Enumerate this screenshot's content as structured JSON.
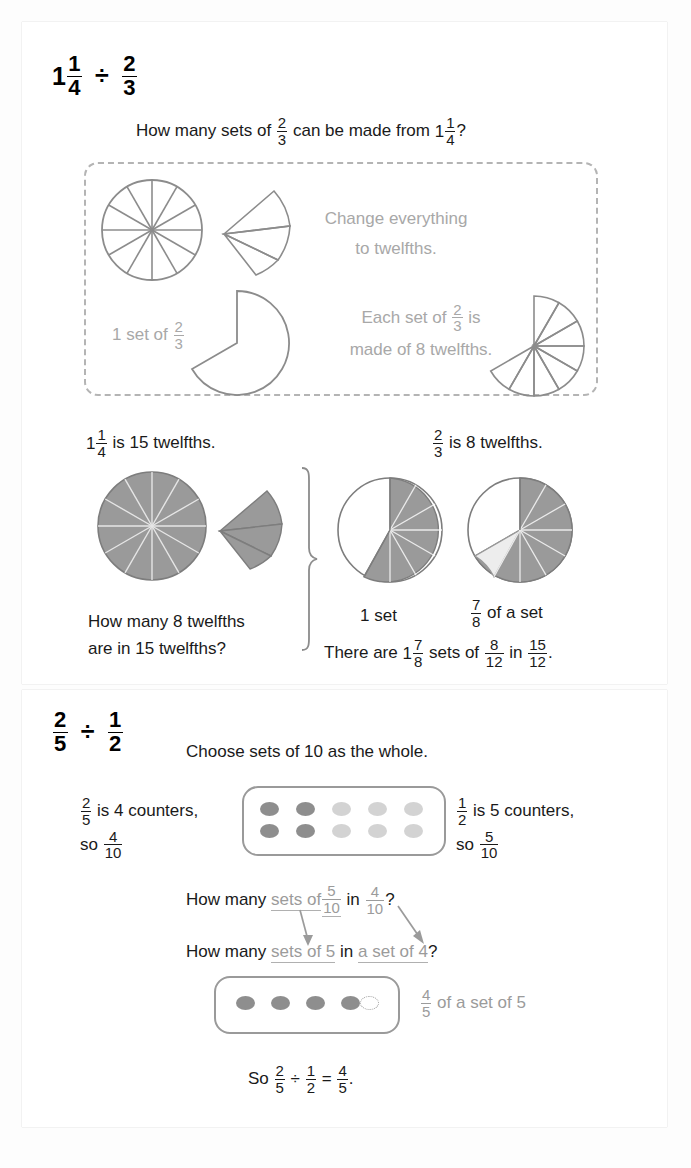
{
  "page": {
    "background_color": "#fdfdfd",
    "sheet_color": "#ffffff",
    "shade_color": "#9a9a9a",
    "light_shade_color": "#e0e0e0",
    "outline_color": "#8c8c8c",
    "gray_text_color": "#a8a8a8",
    "text_color": "#1a1a1a"
  },
  "section1": {
    "heading": {
      "whole": "1",
      "num": "1",
      "den": "4",
      "operator": "÷",
      "divisor_num": "2",
      "divisor_den": "3"
    },
    "question": {
      "before": "How many sets of",
      "frac_num": "2",
      "frac_den": "3",
      "middle": "can be made from",
      "mixed_whole": "1",
      "mixed_num": "1",
      "mixed_den": "4",
      "after": "?"
    },
    "dashed_box": {
      "hint1_line1": "Change everything",
      "hint1_line2": "to twelfths.",
      "label_one_set_before": "1 set of",
      "label_one_set_num": "2",
      "label_one_set_den": "3",
      "hint2_line1_before": "Each set of",
      "hint2_line1_num": "2",
      "hint2_line1_den": "3",
      "hint2_line1_after": "is",
      "hint2_line2": "made of 8 twelfths."
    },
    "labels": {
      "left_whole": "1",
      "left_num": "1",
      "left_den": "4",
      "left_text": "is 15 twelfths.",
      "right_num": "2",
      "right_den": "3",
      "right_text": "is 8 twelfths."
    },
    "bottom": {
      "brace_question_line1": "How many 8 twelfths",
      "brace_question_line2": "are in 15 twelfths?",
      "one_set": "1 set",
      "seven_eighths_num": "7",
      "seven_eighths_den": "8",
      "seven_eighths_text": "of a set",
      "conclusion_before": "There are",
      "conclusion_mixed_whole": "1",
      "conclusion_mixed_num": "7",
      "conclusion_mixed_den": "8",
      "conclusion_mid1": "sets of",
      "conclusion_f1_num": "8",
      "conclusion_f1_den": "12",
      "conclusion_mid2": "in",
      "conclusion_f2_num": "15",
      "conclusion_f2_den": "12",
      "conclusion_end": "."
    }
  },
  "section2": {
    "heading": {
      "num": "2",
      "den": "5",
      "operator": "÷",
      "divisor_num": "1",
      "divisor_den": "2"
    },
    "instruction": "Choose sets of 10 as the whole.",
    "left_label": {
      "num": "2",
      "den": "5",
      "text": "is 4 counters,",
      "so": "so",
      "result_num": "4",
      "result_den": "10"
    },
    "right_label": {
      "num": "1",
      "den": "2",
      "text": "is 5 counters,",
      "so": "so",
      "result_num": "5",
      "result_den": "10"
    },
    "line1": {
      "black": "How many",
      "gray1": "sets of",
      "f1_num": "5",
      "f1_den": "10",
      "black2": "in",
      "f2_num": "4",
      "f2_den": "10",
      "end": "?"
    },
    "line2": {
      "black": "How many",
      "gray1": "sets of 5",
      "black2": "in",
      "gray2": "a set of 4",
      "end": "?"
    },
    "counter_result": {
      "num": "4",
      "den": "5",
      "text": "of a set of 5"
    },
    "conclusion": {
      "so": "So",
      "f1_num": "2",
      "f1_den": "5",
      "operator": "÷",
      "f2_num": "1",
      "f2_den": "2",
      "equals": "=",
      "f3_num": "4",
      "f3_den": "5",
      "period": "."
    }
  },
  "counters_top": {
    "rows": 2,
    "cols": 5,
    "dark_count": 4,
    "light_count": 6
  },
  "counters_bottom": {
    "filled_count": 4,
    "empty_count": 1
  },
  "pies": {
    "twelfths_total": 12,
    "pie1_sectors_shaded": 12,
    "wedge1_sectors": 3,
    "pie_one_set_shaded": 8,
    "pie_seven_eighths_dark": 7,
    "pie_seven_eighths_light": 1,
    "fan_sectors": 8,
    "two_thirds_degrees": 240
  }
}
